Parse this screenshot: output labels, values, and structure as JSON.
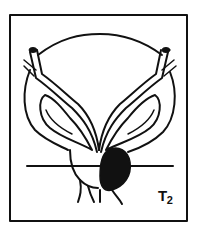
{
  "figure": {
    "stage_label": {
      "letter": "T",
      "subscript": "2"
    },
    "colors": {
      "ink": "#111111",
      "background": "#ffffff",
      "tumor": "#111111"
    }
  }
}
